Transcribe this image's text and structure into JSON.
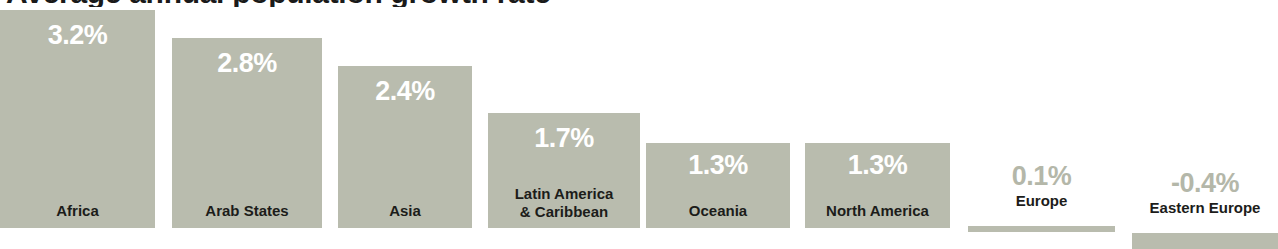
{
  "title": {
    "text": "Average annual population growth rate",
    "cropped": true
  },
  "colors": {
    "bar": "#b9bcae",
    "background": "#ffffff",
    "value_label_inside": "#ffffff",
    "value_label_outside": "#b4b7a9",
    "category_label": "#1c1c1a"
  },
  "chart_data": {
    "type": "bar",
    "title": "Average annual population growth rate",
    "xlabel": "",
    "ylabel": "",
    "ylim": [
      -0.4,
      3.2
    ],
    "grid": false,
    "legend": null,
    "orientation": "vertical",
    "categories": [
      "Africa",
      "Arab States",
      "Asia",
      "Latin America & Caribbean",
      "Oceania",
      "North America",
      "Europe",
      "Eastern Europe"
    ],
    "values": [
      3.2,
      2.8,
      2.4,
      1.7,
      1.3,
      1.3,
      0.1,
      -0.4
    ],
    "value_labels": [
      "3.2%",
      "2.8%",
      "2.4%",
      "1.7%",
      "1.3%",
      "1.3%",
      "0.1%",
      "-0.4%"
    ]
  },
  "bars": [
    {
      "category": "Africa",
      "label_lines": [
        "Africa"
      ],
      "value": 3.2,
      "value_label": "3.2%",
      "label_style": "inside",
      "value_style": "inside"
    },
    {
      "category": "Arab States",
      "label_lines": [
        "Arab States"
      ],
      "value": 2.8,
      "value_label": "2.8%",
      "label_style": "inside",
      "value_style": "inside"
    },
    {
      "category": "Asia",
      "label_lines": [
        "Asia"
      ],
      "value": 2.4,
      "value_label": "2.4%",
      "label_style": "inside",
      "value_style": "inside"
    },
    {
      "category": "Latin America & Caribbean",
      "label_lines": [
        "Latin America",
        "& Caribbean"
      ],
      "value": 1.7,
      "value_label": "1.7%",
      "label_style": "inside",
      "value_style": "inside"
    },
    {
      "category": "Oceania",
      "label_lines": [
        "Oceania"
      ],
      "value": 1.3,
      "value_label": "1.3%",
      "label_style": "inside",
      "value_style": "inside"
    },
    {
      "category": "North America",
      "label_lines": [
        "North America"
      ],
      "value": 1.3,
      "value_label": "1.3%",
      "label_style": "inside",
      "value_style": "inside"
    },
    {
      "category": "Europe",
      "label_lines": [
        "Europe"
      ],
      "value": 0.1,
      "value_label": "0.1%",
      "label_style": "outside",
      "value_style": "outside"
    },
    {
      "category": "Eastern Europe",
      "label_lines": [
        "Eastern Europe"
      ],
      "value": -0.4,
      "value_label": "-0.4%",
      "label_style": "outside",
      "value_style": "outside"
    }
  ]
}
